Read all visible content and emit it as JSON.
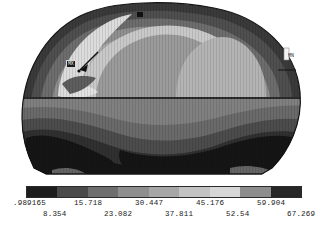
{
  "plot": {
    "title": "FEA contour plot",
    "annotations": {
      "max_tag": "MX",
      "min_tag": "MN"
    }
  },
  "legend": {
    "name": "contour-color-bar",
    "band_count": 9,
    "band_colors": [
      "#1d1d1d",
      "#4a4a4a",
      "#6e6e6e",
      "#8e8e8e",
      "#a6a6a6",
      "#c2c2c2",
      "#d6d6d6",
      "#8d8d8d",
      "#272727"
    ],
    "tick_labels_upper": [
      ".989165",
      "15.718",
      "30.447",
      "45.176",
      "59.904"
    ],
    "tick_labels_lower": [
      "8.354",
      "23.082",
      "37.811",
      "52.54",
      "67.269"
    ],
    "tick_labels_all": [
      ".989165",
      "8.354",
      "15.718",
      "23.082",
      "30.447",
      "37.811",
      "45.176",
      "52.54",
      "59.904",
      "67.269"
    ]
  },
  "chart_data": {
    "type": "heatmap",
    "title": "",
    "xlabel": "",
    "ylabel": "",
    "colorbar_min": 0.989165,
    "colorbar_max": 67.269,
    "contour_levels": [
      0.989165,
      8.354,
      15.718,
      23.082,
      30.447,
      37.811,
      45.176,
      52.54,
      59.904,
      67.269
    ],
    "level_step": 7.364,
    "grid": false,
    "legend_position": "bottom",
    "colormap": "grayscale-banded",
    "annotations": [
      {
        "label": "MX",
        "x": 0.22,
        "y": 0.34
      },
      {
        "label": "MN",
        "x": 0.9,
        "y": 0.3
      }
    ]
  }
}
